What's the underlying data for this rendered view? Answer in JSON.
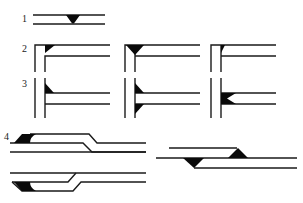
{
  "diagram": {
    "type": "schematic line drawings with triangular fillets",
    "colors": {
      "line": "#1a1a1a",
      "fill": "#0a0a0a",
      "background": "#ffffff"
    },
    "rows": [
      {
        "label": "1",
        "description": "two parallel horizontal lines with a downward triangle on the lower line"
      },
      {
        "label": "2",
        "description": "three corner/T junctions (vertical pair meeting horizontal pair) with triangular fillets at top"
      },
      {
        "label": "3",
        "description": "three T-junctions of vertical pair with horizontal pair, fillets at different positions"
      },
      {
        "label": "4",
        "description": "stepped/offset parallel line pairs with filled fillet wedges, three variants"
      }
    ]
  }
}
